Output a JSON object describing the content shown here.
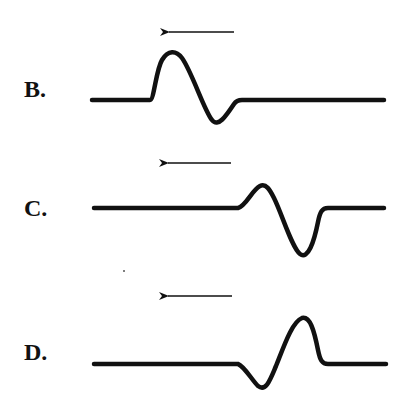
{
  "panels": [
    {
      "label": "B.",
      "direction": "left",
      "arrow": {
        "x1": 234,
        "x2": 167,
        "y": 32
      },
      "wave": "M 92 100 L 150 100 C 154 100, 156 70, 162 60 C 168 50, 176 50, 182 58 C 192 72, 204 110, 212 120 C 218 128, 226 116, 234 104 C 236 101, 238 100, 242 100 L 384 100",
      "shape": "positive pulse leading (left), negative trough trailing (right), peak larger than trough"
    },
    {
      "label": "C.",
      "direction": "left",
      "arrow": {
        "x1": 231,
        "x2": 166,
        "y": 163
      },
      "wave": "M 94 208 L 238 208 C 246 206, 252 190, 260 186 C 266 183, 270 190, 274 198 C 282 214, 292 248, 300 254 C 308 260, 314 242, 318 222 C 320 212, 322 208, 328 208 L 384 208",
      "shape": "small positive peak leading, large negative trough trailing"
    },
    {
      "label": "D.",
      "direction": "left",
      "arrow": {
        "x1": 232,
        "x2": 166,
        "y": 296
      },
      "wave": "M 94 364 L 238 364 C 244 366, 252 380, 258 386 C 266 392, 270 380, 276 366 C 284 346, 292 322, 302 318 C 310 316, 314 330, 318 350 C 320 360, 322 364, 328 364 L 386 364",
      "shape": "small negative trough leading, large positive peak trailing"
    }
  ],
  "colors": {
    "ink": "#111111",
    "background": "#ffffff"
  }
}
